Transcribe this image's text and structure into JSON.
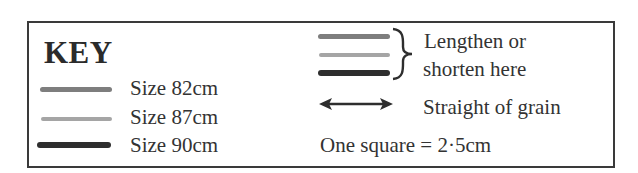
{
  "key": {
    "title": "KEY",
    "items": [
      {
        "label": "Size 82cm",
        "color": "#808080",
        "thickness": 4
      },
      {
        "label": "Size 87cm",
        "color": "#a6a6a6",
        "thickness": 3
      },
      {
        "label": "Size 90cm",
        "color": "#2f2f2f",
        "thickness": 5
      }
    ]
  },
  "lengthen": {
    "line1": "Lengthen or",
    "line2": "shorten here"
  },
  "grain": {
    "label": "Straight of grain"
  },
  "scale": {
    "label": "One square = 2·5cm"
  }
}
